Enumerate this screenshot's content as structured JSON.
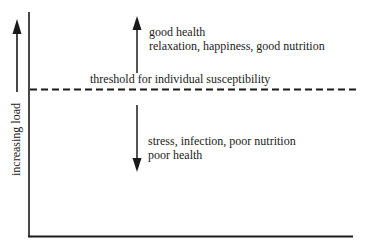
{
  "diagram": {
    "y_axis_label": "increasing load",
    "threshold_label": "threshold for individual susceptibility",
    "above": {
      "line1": "good health",
      "line2": "relaxation, happiness, good nutrition"
    },
    "below": {
      "line1": "stress, infection, poor nutrition",
      "line2": "poor health"
    },
    "colors": {
      "ink": "#1a1a1a",
      "background": "#ffffff"
    }
  }
}
